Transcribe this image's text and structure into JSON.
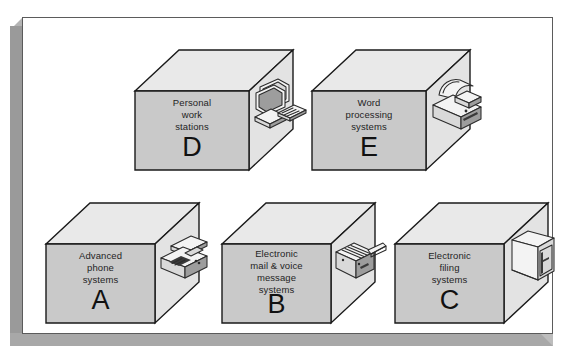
{
  "figure": {
    "name": "office-systems-boxes-diagram",
    "panel_background": "#ffffff",
    "panel_border_color": "#5b5b5b",
    "shadow_color": "#9a9a9a",
    "box_front_color": "#c9c9c9",
    "box_top_color": "#e9e9e9",
    "box_side_color": "#e3e3e3"
  },
  "boxes": [
    {
      "letter": "D",
      "caption": "Personal\nwork\nstations",
      "caption_lines": [
        "Personal",
        "work",
        "stations"
      ],
      "icon": "desktop-computer-workstation-icon",
      "row": "top",
      "column": 1
    },
    {
      "letter": "E",
      "caption": "Word\nprocessing\nsystems",
      "caption_lines": [
        "Word",
        "processing",
        "systems"
      ],
      "icon": "printer-icon",
      "row": "top",
      "column": 2
    },
    {
      "letter": "A",
      "caption": "Advanced\nphone\nsystems",
      "caption_lines": [
        "Advanced",
        "phone",
        "systems"
      ],
      "icon": "telephone-icon",
      "row": "bottom",
      "column": 1
    },
    {
      "letter": "B",
      "caption": "Electronic\nmail & voice\nmessage\nsystems",
      "caption_lines": [
        "Electronic",
        "mail & voice",
        "message",
        "systems"
      ],
      "icon": "fax-answering-machine-icon",
      "row": "bottom",
      "column": 2
    },
    {
      "letter": "C",
      "caption": "Electronic\nfiling\nsystems",
      "caption_lines": [
        "Electronic",
        "filing",
        "systems"
      ],
      "icon": "filing-cabinet-icon",
      "row": "bottom",
      "column": 3
    }
  ]
}
